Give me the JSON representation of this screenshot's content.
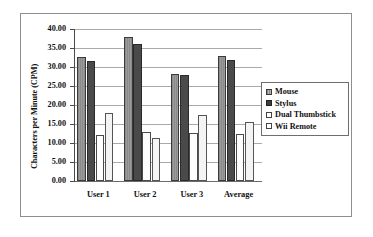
{
  "chart_data": {
    "type": "bar",
    "title": "",
    "xlabel": "",
    "ylabel": "Characters per Minute (CPM)",
    "ylim": [
      0,
      40
    ],
    "ytick_step": 5,
    "ytick_labels": [
      "40.00",
      "35.00",
      "30.00",
      "25.00",
      "20.00",
      "15.00",
      "10.00",
      "5.00",
      "0.00"
    ],
    "ytick_values": [
      40,
      35,
      30,
      25,
      20,
      15,
      10,
      5,
      0
    ],
    "categories": [
      "User 1",
      "User 2",
      "User 3",
      "Average"
    ],
    "grid": true,
    "grid_axis": "y",
    "legend_position": "right",
    "series": [
      {
        "name": "Mouse",
        "color": "#8d8d8d",
        "values": [
          32.6,
          37.8,
          28.2,
          32.9
        ]
      },
      {
        "name": "Stylus",
        "color": "#4a4a4a",
        "values": [
          31.5,
          36.1,
          28.0,
          31.8
        ]
      },
      {
        "name": "Dual Thumbstick",
        "color": "#fdfdfd",
        "values": [
          12.1,
          12.9,
          12.7,
          12.4
        ]
      },
      {
        "name": "Wii Remote",
        "color": "#f4f4f4",
        "values": [
          18.0,
          11.2,
          17.5,
          15.4
        ]
      }
    ]
  }
}
